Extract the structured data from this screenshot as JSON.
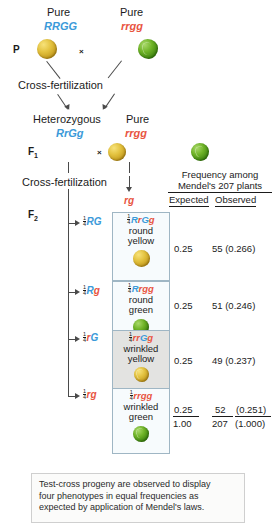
{
  "generations": {
    "p_label": "P",
    "f1_label": "F",
    "f1_sub": "1",
    "f2_label": "F",
    "f2_sub": "2"
  },
  "parents": {
    "left": {
      "purity": "Pure",
      "genotype": "RRGG",
      "pea": "round-yellow"
    },
    "right": {
      "purity": "Pure",
      "genotype": "rrgg",
      "pea": "wrinkled-green"
    },
    "cross_symbol": "×"
  },
  "f1": {
    "left": {
      "purity": "Heterozygous",
      "genotype": "RrGg",
      "pea": "round-yellow"
    },
    "right": {
      "purity": "Pure",
      "genotype": "rrgg",
      "pea": "wrinkled-green"
    },
    "cross_symbol": "×"
  },
  "cross_fertilization_1": "Cross-fertilization",
  "cross_fertilization_2": "Cross-fertilization",
  "tester_gamete": "rg",
  "table_header": {
    "line1": "Frequency among",
    "line2": "Mendel's 207 plants",
    "expected": "Expected",
    "observed": "Observed"
  },
  "rows": [
    {
      "gamete_num": "1",
      "gamete_den": "4",
      "gamete": "RG",
      "gamete_parts": [
        {
          "t": "R",
          "c": "blue"
        },
        {
          "t": "G",
          "c": "blue"
        }
      ],
      "geno_num": "1",
      "geno_den": "4",
      "geno_parts": [
        {
          "t": "R",
          "c": "blue"
        },
        {
          "t": "r",
          "c": "red"
        },
        {
          "t": "G",
          "c": "blue"
        },
        {
          "t": "g",
          "c": "red"
        }
      ],
      "pheno_line1": "round",
      "pheno_line2": "yellow",
      "pea": "round-yellow",
      "expected": "0.25",
      "observed": "55 (0.266)",
      "shade": "white"
    },
    {
      "gamete_num": "1",
      "gamete_den": "4",
      "gamete": "Rg",
      "gamete_parts": [
        {
          "t": "R",
          "c": "blue"
        },
        {
          "t": "g",
          "c": "red"
        }
      ],
      "geno_num": "1",
      "geno_den": "4",
      "geno_parts": [
        {
          "t": "R",
          "c": "blue"
        },
        {
          "t": "r",
          "c": "red"
        },
        {
          "t": "g",
          "c": "red"
        },
        {
          "t": "g",
          "c": "red"
        }
      ],
      "pheno_line1": "round",
      "pheno_line2": "green",
      "pea": "round-green",
      "expected": "0.25",
      "observed": "51 (0.246)",
      "shade": "white"
    },
    {
      "gamete_num": "1",
      "gamete_den": "4",
      "gamete": "rG",
      "gamete_parts": [
        {
          "t": "r",
          "c": "red"
        },
        {
          "t": "G",
          "c": "blue"
        }
      ],
      "geno_num": "1",
      "geno_den": "4",
      "geno_parts": [
        {
          "t": "r",
          "c": "red"
        },
        {
          "t": "r",
          "c": "red"
        },
        {
          "t": "G",
          "c": "blue"
        },
        {
          "t": "g",
          "c": "red"
        }
      ],
      "pheno_line1": "wrinkled",
      "pheno_line2": "yellow",
      "pea": "wrinkled-yellow",
      "expected": "0.25",
      "observed": "49 (0.237)",
      "shade": "gray"
    },
    {
      "gamete_num": "1",
      "gamete_den": "4",
      "gamete": "rg",
      "gamete_parts": [
        {
          "t": "r",
          "c": "red"
        },
        {
          "t": "g",
          "c": "red"
        }
      ],
      "geno_num": "1",
      "geno_den": "4",
      "geno_parts": [
        {
          "t": "r",
          "c": "red"
        },
        {
          "t": "r",
          "c": "red"
        },
        {
          "t": "g",
          "c": "red"
        },
        {
          "t": "g",
          "c": "red"
        }
      ],
      "pheno_line1": "wrinkled",
      "pheno_line2": "green",
      "pea": "wrinkled-green",
      "expected": "0.25",
      "observed": "52",
      "observed_paren": "(0.251)",
      "shade": "white"
    }
  ],
  "totals": {
    "expected": "1.00",
    "observed_count": "207",
    "observed_paren": "(1.000)"
  },
  "caption": {
    "line1": "Test-cross progeny are observed to display",
    "line2": "four phenotypes in equal frequencies as",
    "line3": "expected by application of Mendel's laws."
  },
  "colors": {
    "dominant_allele": "#3b9ad9",
    "recessive_allele": "#e8543f",
    "line": "#4a4a4a",
    "box_border": "#9fb6c4",
    "shaded_box": "#e3e3e1"
  }
}
